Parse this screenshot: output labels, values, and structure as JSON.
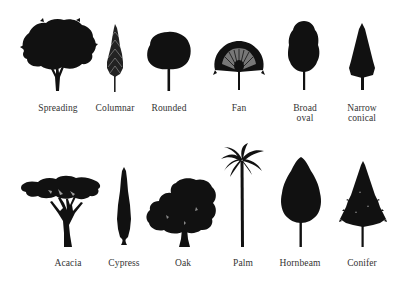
{
  "colors": {
    "silhouette": "#111111",
    "background": "#ffffff",
    "label": "#333333"
  },
  "rows": [
    {
      "name": "top-row",
      "trees": [
        {
          "id": "spreading",
          "label_lines": [
            "Spreading"
          ]
        },
        {
          "id": "columnar",
          "label_lines": [
            "Columnar"
          ]
        },
        {
          "id": "rounded",
          "label_lines": [
            "Rounded"
          ]
        },
        {
          "id": "fan",
          "label_lines": [
            "Fan"
          ]
        },
        {
          "id": "broad-oval",
          "label_lines": [
            "Broad",
            "oval"
          ]
        },
        {
          "id": "narrow-conical",
          "label_lines": [
            "Narrow",
            "conical"
          ]
        }
      ]
    },
    {
      "name": "bottom-row",
      "trees": [
        {
          "id": "acacia",
          "label_lines": [
            "Acacia"
          ]
        },
        {
          "id": "cypress",
          "label_lines": [
            "Cypress"
          ]
        },
        {
          "id": "oak",
          "label_lines": [
            "Oak"
          ]
        },
        {
          "id": "palm",
          "label_lines": [
            "Palm"
          ]
        },
        {
          "id": "hornbeam",
          "label_lines": [
            "Hornbeam"
          ]
        },
        {
          "id": "conifer",
          "label_lines": [
            "Conifer"
          ]
        }
      ]
    }
  ]
}
